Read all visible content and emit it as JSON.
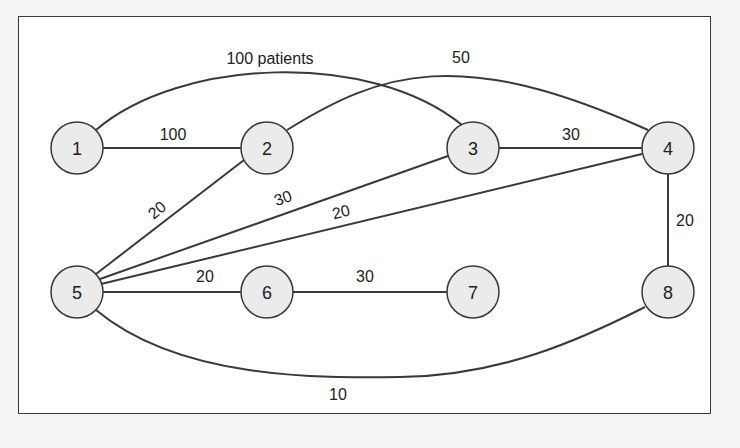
{
  "diagram": {
    "type": "network-graph",
    "colors": {
      "background": "#f4f4f4",
      "panel": "#ffffff",
      "stroke": "#3a3a3a",
      "node_fill": "#ebebeb",
      "text": "#222222"
    },
    "nodes": [
      {
        "id": "1",
        "label": "1",
        "x": 77,
        "y": 148
      },
      {
        "id": "2",
        "label": "2",
        "x": 267,
        "y": 148
      },
      {
        "id": "3",
        "label": "3",
        "x": 473,
        "y": 148
      },
      {
        "id": "4",
        "label": "4",
        "x": 668,
        "y": 148
      },
      {
        "id": "5",
        "label": "5",
        "x": 77,
        "y": 292
      },
      {
        "id": "6",
        "label": "6",
        "x": 267,
        "y": 292
      },
      {
        "id": "7",
        "label": "7",
        "x": 473,
        "y": 292
      },
      {
        "id": "8",
        "label": "8",
        "x": 668,
        "y": 292
      }
    ],
    "edges": [
      {
        "from": "1",
        "to": "3",
        "label": "100 patients",
        "shape": "arc-top"
      },
      {
        "from": "2",
        "to": "4",
        "label": "50",
        "shape": "arc-top"
      },
      {
        "from": "1",
        "to": "2",
        "label": "100",
        "shape": "straight"
      },
      {
        "from": "3",
        "to": "4",
        "label": "30",
        "shape": "straight"
      },
      {
        "from": "5",
        "to": "2",
        "label": "20",
        "shape": "straight"
      },
      {
        "from": "5",
        "to": "3",
        "label": "30",
        "shape": "straight"
      },
      {
        "from": "5",
        "to": "4",
        "label": "20",
        "shape": "straight"
      },
      {
        "from": "5",
        "to": "6",
        "label": "20",
        "shape": "straight"
      },
      {
        "from": "6",
        "to": "7",
        "label": "30",
        "shape": "straight"
      },
      {
        "from": "4",
        "to": "8",
        "label": "20",
        "shape": "straight"
      },
      {
        "from": "5",
        "to": "8",
        "label": "10",
        "shape": "arc-bottom"
      }
    ]
  }
}
